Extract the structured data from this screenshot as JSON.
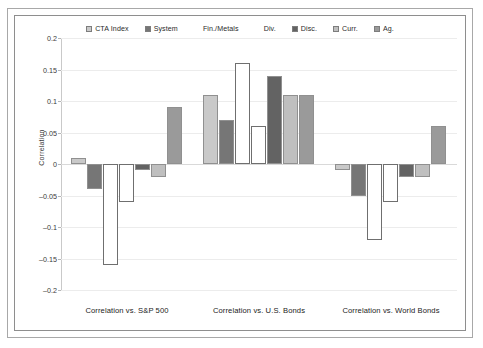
{
  "chart_data": {
    "type": "bar",
    "title": "",
    "xlabel": "",
    "ylabel": "Correlation",
    "ylim": [
      -0.2,
      0.2
    ],
    "ytick_labels": [
      "0.2",
      "0.15",
      "0.1",
      "0.05",
      "0",
      "–0.05",
      "–0.1",
      "–0.15",
      "–0.2"
    ],
    "ytick_values": [
      0.2,
      0.15,
      0.1,
      0.05,
      0,
      -0.05,
      -0.1,
      -0.15,
      -0.2
    ],
    "grid": true,
    "legend_position": "top-center",
    "categories": [
      "Correlation vs. S&P 500",
      "Correlation vs. U.S. Bonds",
      "Correlation vs. World Bonds"
    ],
    "series": [
      {
        "name": "CTA Index",
        "color": "#c9c9c9",
        "values": [
          0.01,
          0.11,
          -0.01
        ]
      },
      {
        "name": "System",
        "color": "#767676",
        "values": [
          -0.04,
          0.07,
          -0.05
        ]
      },
      {
        "name": "Fin./Metals",
        "color": "#ffffff",
        "values": [
          -0.16,
          0.16,
          -0.12
        ]
      },
      {
        "name": "Div.",
        "color": "#ffffff",
        "values": [
          -0.06,
          0.06,
          -0.06
        ]
      },
      {
        "name": "Disc.",
        "color": "#636363",
        "values": [
          -0.01,
          0.14,
          -0.02
        ]
      },
      {
        "name": "Curr.",
        "color": "#bfbfbf",
        "values": [
          -0.02,
          0.11,
          -0.02
        ]
      },
      {
        "name": "Ag.",
        "color": "#9a9a9a",
        "values": [
          0.09,
          0.11,
          0.06
        ]
      }
    ]
  },
  "legend": {
    "items": [
      {
        "label": "CTA Index",
        "color": "#c9c9c9",
        "hollow": false
      },
      {
        "label": "System",
        "color": "#767676",
        "hollow": false
      },
      {
        "label": "Fin./Metals",
        "color": "#ffffff",
        "hollow": true
      },
      {
        "label": "Div.",
        "color": "#ffffff",
        "hollow": true
      },
      {
        "label": "Disc.",
        "color": "#636363",
        "hollow": false
      },
      {
        "label": "Curr.",
        "color": "#bfbfbf",
        "hollow": false
      },
      {
        "label": "Ag.",
        "color": "#9a9a9a",
        "hollow": false
      }
    ]
  },
  "axis": {
    "y_title": "Correlation"
  }
}
